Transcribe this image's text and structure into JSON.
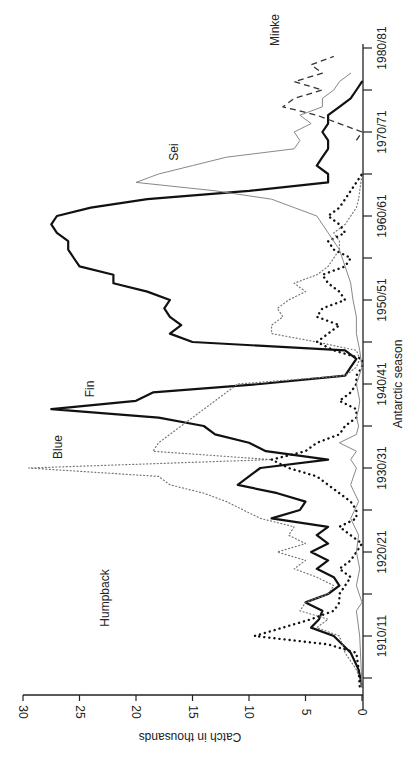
{
  "chart_data": {
    "type": "line",
    "title": "",
    "xlabel": "Antarctic season",
    "ylabel": "Catch in thousands",
    "orientation": "rotated 90 degrees clockwise (seasons run bottom-to-top along right edge, catch runs right-to-left)",
    "ylim": [
      0,
      30
    ],
    "yticks": [
      "0",
      "5",
      "10",
      "15",
      "20",
      "25",
      "30"
    ],
    "xticks": [
      "1910/11",
      "1920/21",
      "1930/31",
      "1940/41",
      "1950/51",
      "1960/61",
      "1970/71",
      "1980/81"
    ],
    "grid": false,
    "legend": "inline labels",
    "series": [
      {
        "name": "Fin",
        "style": "solid thick",
        "x": [
          1904,
          1906,
          1908,
          1910,
          1911,
          1912,
          1913,
          1914,
          1915,
          1916,
          1917,
          1918,
          1919,
          1920,
          1921,
          1922,
          1923,
          1924,
          1925,
          1926,
          1927,
          1928,
          1929,
          1930,
          1931,
          1932,
          1933,
          1934,
          1935,
          1936,
          1937,
          1938,
          1939,
          1940,
          1941,
          1942,
          1943,
          1944,
          1945,
          1946,
          1947,
          1948,
          1949,
          1950,
          1951,
          1952,
          1953,
          1954,
          1955,
          1956,
          1957,
          1958,
          1959,
          1960,
          1961,
          1962,
          1963,
          1964,
          1965,
          1966,
          1967,
          1968,
          1969,
          1970,
          1971,
          1972,
          1973,
          1974,
          1975,
          1976
        ],
        "values": [
          0,
          0.3,
          1,
          2.5,
          4.5,
          3.8,
          3.5,
          5,
          3,
          2,
          2.5,
          4,
          3,
          4.5,
          3,
          4,
          3,
          8,
          5.5,
          5,
          7.5,
          11,
          10,
          9,
          3,
          8.5,
          10,
          13,
          14,
          18,
          27.5,
          20,
          18.5,
          9,
          1.5,
          1,
          0.5,
          1.5,
          15,
          17,
          16,
          17,
          17.5,
          17,
          19,
          22,
          22,
          25,
          25.5,
          26,
          26,
          27,
          27.5,
          27,
          24,
          19,
          10,
          3,
          3,
          4,
          3.5,
          3,
          3,
          3.5,
          3,
          3,
          2,
          1,
          0.5,
          0
        ]
      },
      {
        "name": "Blue",
        "style": "fine dotted",
        "x": [
          1904,
          1906,
          1908,
          1910,
          1911,
          1912,
          1913,
          1914,
          1915,
          1916,
          1917,
          1918,
          1919,
          1920,
          1921,
          1922,
          1923,
          1924,
          1925,
          1926,
          1927,
          1928,
          1929,
          1930,
          1931,
          1932,
          1933,
          1934,
          1935,
          1936,
          1937,
          1938,
          1939,
          1940,
          1941,
          1942,
          1943,
          1944,
          1945,
          1946,
          1947,
          1948,
          1949,
          1950,
          1951,
          1952,
          1953,
          1954,
          1955,
          1956,
          1957,
          1958,
          1959,
          1960,
          1961,
          1962,
          1963,
          1964,
          1965
        ],
        "values": [
          0,
          0.5,
          1.5,
          2,
          4,
          3,
          5.5,
          5,
          3,
          2.5,
          4,
          6,
          5,
          7.5,
          5,
          6.5,
          6,
          9,
          10.5,
          12,
          14,
          17,
          18,
          29.5,
          8,
          18.5,
          18,
          17,
          16,
          15,
          14,
          13,
          12,
          11,
          1.5,
          0.5,
          0.2,
          0.5,
          4,
          8,
          8,
          7,
          7.5,
          6.5,
          5,
          6,
          4,
          3,
          2.5,
          2,
          2,
          2.5,
          1.5,
          1,
          0.5,
          0.3,
          0.2,
          0.1,
          0
        ]
      },
      {
        "name": "Humpback",
        "style": "heavy dotted",
        "x": [
          1904,
          1906,
          1908,
          1909,
          1910,
          1911,
          1912,
          1913,
          1914,
          1915,
          1916,
          1917,
          1918,
          1919,
          1920,
          1921,
          1922,
          1923,
          1924,
          1925,
          1926,
          1927,
          1928,
          1929,
          1930,
          1931,
          1932,
          1933,
          1934,
          1935,
          1936,
          1937,
          1938,
          1939,
          1940,
          1941,
          1942,
          1943,
          1944,
          1945,
          1946,
          1947,
          1948,
          1949,
          1950,
          1951,
          1952,
          1953,
          1954,
          1955,
          1956,
          1957,
          1958,
          1959,
          1960,
          1961,
          1962,
          1963,
          1964,
          1965
        ],
        "values": [
          0.2,
          0.3,
          0.5,
          3,
          9.5,
          7,
          4.5,
          2.5,
          2,
          2,
          1.5,
          1,
          2,
          1,
          0.5,
          0,
          1,
          2,
          0.5,
          0.5,
          1,
          2,
          3,
          4,
          6.5,
          8,
          5,
          4,
          2,
          1.5,
          0.5,
          0.5,
          2,
          1,
          0.5,
          0.5,
          0,
          0,
          2.5,
          4,
          3,
          2,
          4,
          3.5,
          1.5,
          2,
          3,
          3.5,
          1.5,
          1,
          2.5,
          3,
          1.5,
          2,
          3,
          2,
          1.5,
          1,
          0.5,
          0
        ]
      },
      {
        "name": "Sei",
        "style": "thin solid grey",
        "x": [
          1904,
          1910,
          1913,
          1914,
          1916,
          1918,
          1920,
          1922,
          1924,
          1926,
          1928,
          1930,
          1931,
          1932,
          1933,
          1934,
          1935,
          1936,
          1937,
          1938,
          1940,
          1942,
          1944,
          1946,
          1948,
          1950,
          1952,
          1954,
          1956,
          1958,
          1960,
          1961,
          1962,
          1963,
          1964,
          1965,
          1966,
          1967,
          1968,
          1969,
          1970,
          1971,
          1972,
          1973,
          1974,
          1975,
          1976,
          1977
        ],
        "values": [
          0,
          0.2,
          0.5,
          0,
          0.5,
          0.2,
          0.5,
          0.3,
          1,
          0.3,
          1,
          0.5,
          1,
          0.5,
          2,
          0.5,
          0.3,
          0.5,
          0.3,
          0.2,
          0.5,
          0,
          0.2,
          0.5,
          0.5,
          0.8,
          1,
          1.5,
          2,
          3,
          4,
          6,
          8,
          13,
          20,
          18,
          15,
          12,
          6,
          5.5,
          6,
          4.5,
          5.5,
          3.5,
          3.5,
          2.5,
          2,
          1
        ]
      },
      {
        "name": "Minke",
        "style": "dashed",
        "x": [
          1969,
          1970,
          1971,
          1972,
          1973,
          1974,
          1975,
          1976,
          1977,
          1978,
          1979
        ],
        "values": [
          0.5,
          0,
          2,
          4,
          7,
          6,
          3.5,
          6,
          3.5,
          4.5,
          2.5
        ]
      }
    ],
    "annotations": [
      "Humpback",
      "Blue",
      "Fin",
      "Sei",
      "Minke"
    ]
  },
  "labels": {
    "xlabel": "Antarctic season",
    "ylabel": "Catch in thousands",
    "series_fin": "Fin",
    "series_blue": "Blue",
    "series_humpback": "Humpback",
    "series_sei": "Sei",
    "series_minke": "Minke"
  },
  "ticks": {
    "catch": [
      "0",
      "5",
      "10",
      "15",
      "20",
      "25",
      "30"
    ],
    "season": [
      "1910/11",
      "1920/21",
      "1930/31",
      "1940/41",
      "1950/51",
      "1960/61",
      "1970/71",
      "1980/81"
    ]
  }
}
